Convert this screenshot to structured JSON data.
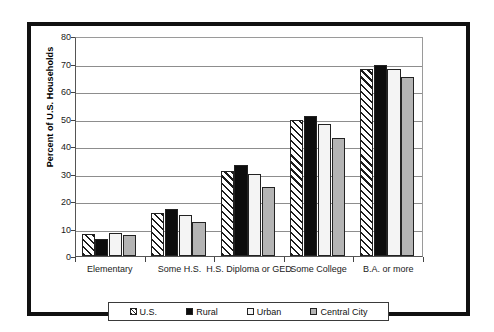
{
  "chart_data": {
    "type": "bar",
    "title": "",
    "xlabel": "",
    "ylabel": "Percent of U.S. Households",
    "ylim": [
      0,
      80
    ],
    "ytick_step": 10,
    "yticks": [
      80,
      70,
      60,
      50,
      40,
      30,
      20,
      10,
      0
    ],
    "grid": true,
    "legend_position": "bottom",
    "categories": [
      "Elementary",
      "Some H.S.",
      "H.S. Diploma or GED",
      "Some College",
      "B.A. or more"
    ],
    "series": [
      {
        "name": "U.S.",
        "pattern": "diagonal-hatch",
        "color": "#ffffff",
        "values": [
          8.0,
          15.5,
          31.0,
          49.5,
          68.0
        ]
      },
      {
        "name": "Rural",
        "pattern": "solid",
        "color": "#0d0d0d",
        "values": [
          6.3,
          17.0,
          33.0,
          51.0,
          69.5
        ]
      },
      {
        "name": "Urban",
        "pattern": "solid",
        "color": "#f4f4f4",
        "values": [
          8.5,
          15.0,
          30.0,
          48.0,
          68.0
        ]
      },
      {
        "name": "Central City",
        "pattern": "solid",
        "color": "#b4b4b4",
        "values": [
          7.5,
          12.5,
          25.0,
          43.0,
          65.0
        ]
      }
    ]
  },
  "legend": {
    "items": [
      {
        "label": "U.S."
      },
      {
        "label": "Rural"
      },
      {
        "label": "Urban"
      },
      {
        "label": "Central City"
      }
    ]
  }
}
